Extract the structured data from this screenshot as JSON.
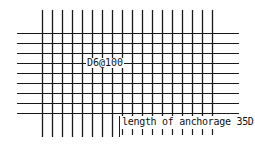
{
  "diagram": {
    "type": "rebar-mesh-detail",
    "labels": {
      "rebar_spec": "D6@100",
      "anchorage": "length of anchorage 35D"
    },
    "grid": {
      "vertical_bars": 18,
      "horizontal_bars": 9,
      "vertical_x_start": 42,
      "vertical_spacing": 10,
      "vertical_y_top": 10,
      "vertical_y_bottom": 137,
      "horizontal_y_start": 33,
      "horizontal_spacing": 10,
      "horizontal_x_left": 17,
      "horizontal_x_right": 239
    },
    "colors": {
      "line": "#1a1a1a",
      "background": "#ffffff"
    }
  }
}
